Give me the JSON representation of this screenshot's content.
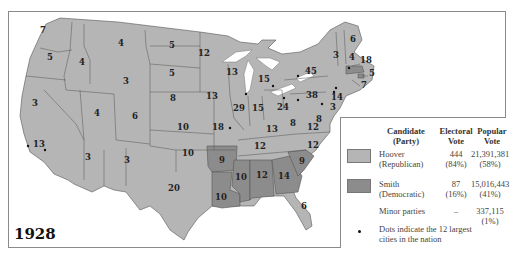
{
  "year": "1928",
  "colors": {
    "hoover": "#b5b5b5",
    "smith": "#8c8c8c",
    "border": "#555555"
  },
  "legend": {
    "headers": {
      "candidate": "Candidate",
      "candidate_sub": "(Party)",
      "electoral": "Electoral",
      "electoral_sub": "Vote",
      "popular": "Popular",
      "popular_sub": "Vote"
    },
    "rows": [
      {
        "name": "Hoover",
        "party": "(Republican)",
        "electoral": "444",
        "electoral_pct": "(84%)",
        "popular": "21,391,381",
        "popular_pct": "(58%)"
      },
      {
        "name": "Smith",
        "party": "(Democratic)",
        "electoral": "87",
        "electoral_pct": "(16%)",
        "popular": "15,016,443",
        "popular_pct": "(41%)"
      },
      {
        "name": "Minor parties",
        "electoral": "–",
        "popular": "337,115",
        "popular_pct": "(1%)"
      }
    ],
    "dots_note_line1": "Dots indicate the 12 largest",
    "dots_note_line2": "cities in the nation"
  },
  "states": [
    {
      "label": "7",
      "x": 43,
      "y": 33
    },
    {
      "label": "5",
      "x": 50,
      "y": 60
    },
    {
      "label": "4",
      "x": 82,
      "y": 65
    },
    {
      "label": "4",
      "x": 121,
      "y": 46
    },
    {
      "label": "5",
      "x": 172,
      "y": 48
    },
    {
      "label": "12",
      "x": 204,
      "y": 56
    },
    {
      "label": "5",
      "x": 172,
      "y": 76
    },
    {
      "label": "3",
      "x": 126,
      "y": 84
    },
    {
      "label": "13",
      "x": 232,
      "y": 75
    },
    {
      "label": "15",
      "x": 264,
      "y": 82
    },
    {
      "label": "45",
      "x": 311,
      "y": 74
    },
    {
      "label": "4",
      "x": 352,
      "y": 60
    },
    {
      "label": "3",
      "x": 336,
      "y": 58
    },
    {
      "label": "6",
      "x": 353,
      "y": 42
    },
    {
      "label": "18",
      "x": 366,
      "y": 63
    },
    {
      "label": "5",
      "x": 372,
      "y": 76
    },
    {
      "label": "7",
      "x": 364,
      "y": 88
    },
    {
      "label": "3",
      "x": 35,
      "y": 106
    },
    {
      "label": "4",
      "x": 97,
      "y": 116
    },
    {
      "label": "6",
      "x": 135,
      "y": 119
    },
    {
      "label": "8",
      "x": 173,
      "y": 101
    },
    {
      "label": "13",
      "x": 212,
      "y": 99
    },
    {
      "label": "29",
      "x": 239,
      "y": 111
    },
    {
      "label": "15",
      "x": 258,
      "y": 111
    },
    {
      "label": "24",
      "x": 283,
      "y": 110
    },
    {
      "label": "38",
      "x": 312,
      "y": 98
    },
    {
      "label": "14",
      "x": 337,
      "y": 100
    },
    {
      "label": "3",
      "x": 333,
      "y": 110
    },
    {
      "label": "8",
      "x": 319,
      "y": 122
    },
    {
      "label": "8",
      "x": 293,
      "y": 126
    },
    {
      "label": "12",
      "x": 313,
      "y": 130
    },
    {
      "label": "13",
      "x": 39,
      "y": 147
    },
    {
      "label": "10",
      "x": 183,
      "y": 130
    },
    {
      "label": "18",
      "x": 218,
      "y": 130
    },
    {
      "label": "13",
      "x": 272,
      "y": 132
    },
    {
      "label": "12",
      "x": 260,
      "y": 149
    },
    {
      "label": "12",
      "x": 313,
      "y": 148
    },
    {
      "label": "10",
      "x": 188,
      "y": 156
    },
    {
      "label": "9",
      "x": 222,
      "y": 163,
      "party": "smith"
    },
    {
      "label": "9",
      "x": 302,
      "y": 164,
      "party": "smith"
    },
    {
      "label": "10",
      "x": 241,
      "y": 180,
      "party": "smith"
    },
    {
      "label": "12",
      "x": 262,
      "y": 178,
      "party": "smith"
    },
    {
      "label": "14",
      "x": 284,
      "y": 179,
      "party": "smith"
    },
    {
      "label": "3",
      "x": 88,
      "y": 160
    },
    {
      "label": "3",
      "x": 127,
      "y": 163
    },
    {
      "label": "20",
      "x": 174,
      "y": 191
    },
    {
      "label": "10",
      "x": 221,
      "y": 200,
      "party": "smith"
    },
    {
      "label": "6",
      "x": 304,
      "y": 209
    }
  ]
}
